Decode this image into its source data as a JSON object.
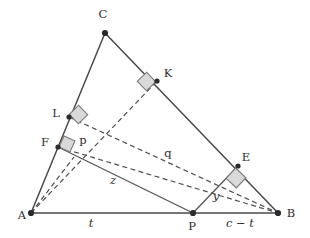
{
  "figure": {
    "type": "geometry-diagram",
    "background_color": "#ffffff",
    "stroke_color": "#4a4a4a",
    "right_angle_fill": "#d9d9d9",
    "right_angle_stroke": "#7a7a7a"
  },
  "vertices": [
    {
      "id": "A",
      "label": "A",
      "x": 31,
      "y": 213,
      "label_x": 22,
      "label_y": 215
    },
    {
      "id": "B",
      "label": "B",
      "x": 278,
      "y": 213,
      "label_x": 290,
      "label_y": 214
    },
    {
      "id": "C",
      "label": "C",
      "x": 105,
      "y": 33,
      "label_x": 103,
      "label_y": 14
    },
    {
      "id": "P",
      "label": "P",
      "x": 193,
      "y": 213,
      "label_x": 192,
      "label_y": 226
    }
  ],
  "feet": [
    {
      "id": "K",
      "label": "K",
      "x": 157,
      "y": 81,
      "label_x": 168,
      "label_y": 74
    },
    {
      "id": "L",
      "label": "L",
      "x": 69,
      "y": 117,
      "label_x": 56,
      "label_y": 114
    },
    {
      "id": "F",
      "label": "F",
      "x": 58,
      "y": 147,
      "label_x": 45,
      "label_y": 143
    },
    {
      "id": "E",
      "label": "E",
      "x": 238,
      "y": 166,
      "label_x": 245,
      "label_y": 158
    }
  ],
  "solid_edges": [
    {
      "name": "side-AB",
      "from": "A",
      "to": "B"
    },
    {
      "name": "side-AC",
      "from": "A",
      "to": "C"
    },
    {
      "name": "side-CB",
      "from": "C",
      "to": "B"
    }
  ],
  "solid_segments": [
    {
      "name": "segment-FP",
      "x1": 58,
      "y1": 147,
      "x2": 193,
      "y2": 213
    },
    {
      "name": "segment-PE",
      "x1": 193,
      "y1": 213,
      "x2": 238,
      "y2": 166
    }
  ],
  "dashed_segments": [
    {
      "name": "dashed-AK",
      "x1": 31,
      "y1": 213,
      "x2": 157,
      "y2": 81
    },
    {
      "name": "dashed-LB",
      "x1": 69,
      "y1": 117,
      "x2": 278,
      "y2": 213
    },
    {
      "name": "dashed-FB",
      "x1": 58,
      "y1": 147,
      "x2": 278,
      "y2": 213
    },
    {
      "name": "dashed-AF-extension",
      "x1": 31,
      "y1": 213,
      "x2": 72,
      "y2": 160
    }
  ],
  "right_angles": [
    {
      "name": "right-angle-at-K",
      "x": 147,
      "y": 86,
      "rotation": 48
    },
    {
      "name": "right-angle-at-L",
      "x": 79,
      "y": 116,
      "rotation": 48
    },
    {
      "name": "right-angle-at-F",
      "x": 68,
      "y": 147,
      "rotation": 26
    },
    {
      "name": "right-angle-at-E",
      "x": 236,
      "y": 178,
      "rotation": 42
    }
  ],
  "segment_labels": [
    {
      "name": "label-t",
      "text": "t",
      "x": 91,
      "y": 224,
      "italic": true
    },
    {
      "name": "label-c-minus-t",
      "text": "c − t",
      "x": 240,
      "y": 224,
      "italic": true
    },
    {
      "name": "label-p",
      "text": "p",
      "x": 83,
      "y": 141,
      "italic": false
    },
    {
      "name": "label-q",
      "text": "q",
      "x": 168,
      "y": 154,
      "italic": false
    },
    {
      "name": "label-z",
      "text": "z",
      "x": 113,
      "y": 181,
      "italic": true
    },
    {
      "name": "label-y",
      "text": "y",
      "x": 216,
      "y": 197,
      "italic": true
    }
  ]
}
